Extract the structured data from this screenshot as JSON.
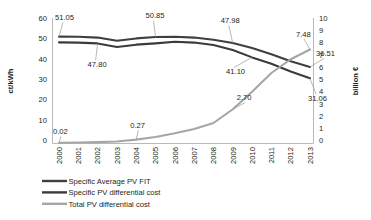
{
  "chart_data": {
    "type": "line",
    "title": "",
    "xlabel": "",
    "ylabel": "ct/kWh",
    "y2label": "billion €",
    "ylim": [
      0,
      60
    ],
    "y2lim": [
      0,
      10
    ],
    "grid": false,
    "legend_position": "bottom-left",
    "categories": [
      "2000",
      "2001",
      "2002",
      "2003",
      "2004",
      "2005",
      "2006",
      "2007",
      "2008",
      "2009",
      "2010",
      "2011",
      "2012",
      "2013"
    ],
    "y_ticks": [
      "0",
      "10",
      "20",
      "30",
      "40",
      "50",
      "60"
    ],
    "y2_ticks": [
      "0",
      "1",
      "2",
      "3",
      "4",
      "5",
      "6",
      "7",
      "8",
      "9",
      "10"
    ],
    "series": [
      {
        "name": "Specific Average PV FIT",
        "axis": "left",
        "color": "#3f3f3f",
        "values": [
          51.05,
          51.0,
          50.6,
          49.1,
          50.2,
          50.85,
          51.0,
          50.6,
          49.6,
          47.98,
          45.6,
          42.6,
          39.2,
          36.51
        ]
      },
      {
        "name": "Specific PV differential cost",
        "axis": "left",
        "color": "#3b3b3b",
        "values": [
          48.3,
          48.2,
          47.8,
          46.1,
          47.2,
          47.8,
          48.6,
          48.2,
          47.0,
          44.6,
          41.1,
          38.0,
          34.3,
          31.06
        ]
      },
      {
        "name": "Total PV differential cost",
        "axis": "right",
        "color": "#a6a6a6",
        "values": [
          0.02,
          0.04,
          0.07,
          0.12,
          0.27,
          0.48,
          0.78,
          1.12,
          1.6,
          2.7,
          4.1,
          5.6,
          6.7,
          7.48
        ]
      }
    ],
    "annotations": [
      {
        "text": "51.05",
        "series": 0,
        "category": "2000"
      },
      {
        "text": "50.85",
        "series": 0,
        "category": "2005"
      },
      {
        "text": "47.98",
        "series": 0,
        "category": "2009"
      },
      {
        "text": "36.51",
        "series": 0,
        "category": "2013"
      },
      {
        "text": "47.80",
        "series": 1,
        "category": "2002"
      },
      {
        "text": "41.10",
        "series": 1,
        "category": "2010"
      },
      {
        "text": "31.06",
        "series": 1,
        "category": "2013"
      },
      {
        "text": "0.02",
        "series": 2,
        "category": "2000"
      },
      {
        "text": "0.27",
        "series": 2,
        "category": "2004"
      },
      {
        "text": "2.70",
        "series": 2,
        "category": "2009"
      },
      {
        "text": "7.48",
        "series": 2,
        "category": "2013"
      }
    ]
  },
  "legend": {
    "items": [
      {
        "label": "Specific Average PV FIT",
        "color": "#3f3f3f"
      },
      {
        "label": "Specific PV differential cost",
        "color": "#3b3b3b"
      },
      {
        "label": "Total PV differential cost",
        "color": "#a6a6a6"
      }
    ]
  }
}
